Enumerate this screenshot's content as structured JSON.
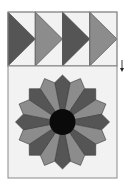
{
  "diagram": {
    "title": "",
    "colors": {
      "background": "#ffffff",
      "panel_fill": "#f2f2f2",
      "border": "#8a8a8a",
      "dark": "#555555",
      "light": "#8c8c8c",
      "center": "#0a0a0a",
      "petal_stroke": "#3a3a3a",
      "arrow": "#222222"
    },
    "flying_geese": {
      "x": 8,
      "y": 12,
      "block_width": 27.25,
      "height": 54,
      "count": 4,
      "blocks": [
        {
          "index": 0,
          "shade": "dark",
          "direction": "right"
        },
        {
          "index": 1,
          "shade": "light",
          "direction": "right"
        },
        {
          "index": 2,
          "shade": "dark",
          "direction": "right"
        },
        {
          "index": 3,
          "shade": "light",
          "direction": "right"
        }
      ]
    },
    "arrow": {
      "direction": "down",
      "x": 122,
      "y1": 60,
      "y2": 72
    },
    "plate_block": {
      "x": 8,
      "y": 66,
      "width": 109,
      "height": 112
    },
    "dresden_plate": {
      "cx": 62.5,
      "cy": 122,
      "petal_count": 16,
      "outer_radius": 47,
      "shoulder_radius": 40,
      "center_radius": 13,
      "petals": [
        {
          "shade": "dark"
        },
        {
          "shade": "light"
        },
        {
          "shade": "dark"
        },
        {
          "shade": "light"
        },
        {
          "shade": "dark"
        },
        {
          "shade": "light"
        },
        {
          "shade": "dark"
        },
        {
          "shade": "light"
        },
        {
          "shade": "dark"
        },
        {
          "shade": "light"
        },
        {
          "shade": "dark"
        },
        {
          "shade": "light"
        },
        {
          "shade": "dark"
        },
        {
          "shade": "light"
        },
        {
          "shade": "dark"
        },
        {
          "shade": "light"
        }
      ]
    }
  }
}
